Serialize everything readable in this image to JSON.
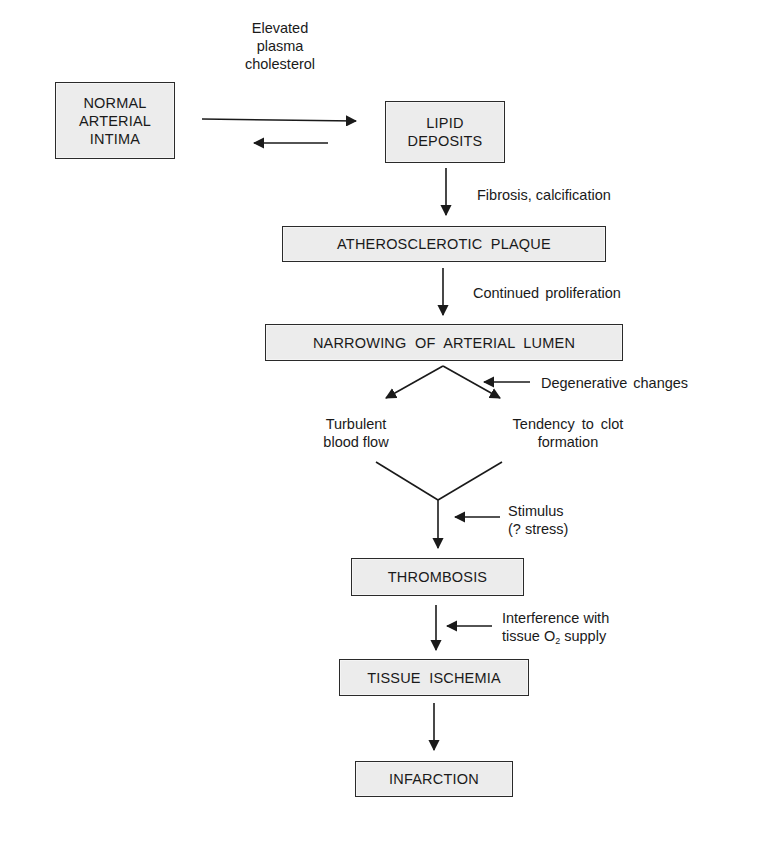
{
  "diagram": {
    "type": "flowchart",
    "topic": "Pathogenesis of atherosclerosis leading to infarction",
    "nodes": [
      {
        "id": "normal",
        "label_lines": [
          "NORMAL",
          "ARTERIAL",
          "INTIMA"
        ]
      },
      {
        "id": "lipid",
        "label_lines": [
          "LIPID",
          "DEPOSITS"
        ]
      },
      {
        "id": "plaque",
        "label": "ATHEROSCLEROTIC  PLAQUE"
      },
      {
        "id": "narrowing",
        "label": "NARROWING  OF  ARTERIAL  LUMEN"
      },
      {
        "id": "thrombosis",
        "label": "THROMBOSIS"
      },
      {
        "id": "ischemia",
        "label": "TISSUE  ISCHEMIA"
      },
      {
        "id": "infarction",
        "label": "INFARCTION"
      }
    ],
    "intermediate_states": [
      {
        "id": "turbulent",
        "label_lines": [
          "Turbulent",
          "blood flow"
        ]
      },
      {
        "id": "clot",
        "label_lines": [
          "Tendency to clot",
          "formation"
        ]
      }
    ],
    "edge_labels": {
      "cholesterol": [
        "Elevated",
        "plasma",
        "cholesterol"
      ],
      "fibrosis": "Fibrosis, calcification",
      "proliferation": "Continued proliferation",
      "degenerative": "Degenerative changes",
      "stimulus": [
        "Stimulus",
        "(? stress)"
      ],
      "interference_line1": "Interference with",
      "interference_line2_pre": "tissue O",
      "interference_sub": "2",
      "interference_line2_post": " supply"
    },
    "edges": [
      {
        "from": "normal",
        "to": "lipid",
        "label": "Elevated plasma cholesterol"
      },
      {
        "from": "lipid",
        "to": "normal",
        "label": ""
      },
      {
        "from": "lipid",
        "to": "plaque",
        "label": "Fibrosis, calcification"
      },
      {
        "from": "plaque",
        "to": "narrowing",
        "label": "Continued proliferation"
      },
      {
        "from": "narrowing",
        "to": "turbulent",
        "label": ""
      },
      {
        "from": "narrowing",
        "to": "clot",
        "label": "Degenerative changes"
      },
      {
        "from": "turbulent",
        "to": "thrombosis",
        "label": "Stimulus (? stress)"
      },
      {
        "from": "clot",
        "to": "thrombosis",
        "label": "Stimulus (? stress)"
      },
      {
        "from": "thrombosis",
        "to": "ischemia",
        "label": "Interference with tissue O2 supply"
      },
      {
        "from": "ischemia",
        "to": "infarction",
        "label": ""
      }
    ]
  }
}
